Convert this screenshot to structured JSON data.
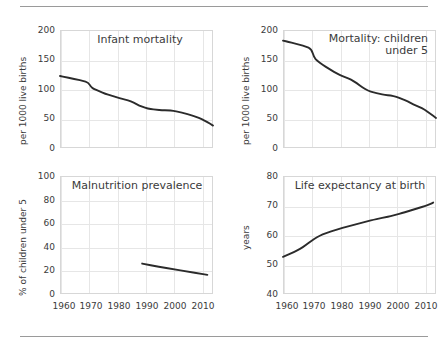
{
  "figure": {
    "background": "#ffffff",
    "line_color": "#2b2b2b",
    "grid_color": "#e6e6e6",
    "frame_color": "#d7d7d7",
    "rule_color": "#9a9a9a"
  },
  "panels": {
    "infant_mortality": {
      "title": "Infant mortality",
      "ylabel": "per 1000 live births",
      "yticks": [
        "200",
        "150",
        "100",
        "50",
        "0"
      ],
      "xticks": [
        "1960",
        "1970",
        "1980",
        "1990",
        "2000",
        "2010"
      ]
    },
    "under5_mortality": {
      "title": "Mortality: children\nunder 5",
      "ylabel": "per 1000 live births",
      "yticks": [
        "200",
        "150",
        "100",
        "50",
        "0"
      ],
      "xticks": [
        "1960",
        "1970",
        "1980",
        "1990",
        "2000",
        "2010"
      ]
    },
    "malnutrition": {
      "title": "Malnutrition prevalence",
      "ylabel": "% of children under 5",
      "yticks": [
        "100",
        "80",
        "60",
        "40",
        "20",
        "0"
      ],
      "xticks": [
        "1960",
        "1970",
        "1980",
        "1990",
        "2000",
        "2010"
      ]
    },
    "life_expectancy": {
      "title": "Life expectancy at birth",
      "ylabel": "years",
      "yticks": [
        "80",
        "70",
        "60",
        "50",
        "40"
      ],
      "xticks": [
        "1960",
        "1970",
        "1980",
        "1990",
        "2000",
        "2010"
      ]
    }
  },
  "chart_data": [
    {
      "type": "line",
      "title": "Infant mortality",
      "xlabel": "",
      "ylabel": "per 1000 live births",
      "xlim": [
        1960,
        2014
      ],
      "ylim": [
        0,
        200
      ],
      "ytick_values": [
        0,
        50,
        100,
        150,
        200
      ],
      "xtick_values": [
        1960,
        1970,
        1980,
        1990,
        2000,
        2010
      ],
      "grid": true,
      "legend": "none",
      "x": [
        1960,
        1962,
        1964,
        1966,
        1968,
        1970,
        1971,
        1972,
        1974,
        1976,
        1978,
        1980,
        1982,
        1984,
        1986,
        1988,
        1990,
        1992,
        1994,
        1996,
        1998,
        2000,
        2002,
        2004,
        2006,
        2008,
        2010,
        2012,
        2014
      ],
      "values": [
        122,
        120,
        118,
        116,
        114,
        111,
        103,
        100,
        96,
        92,
        89,
        86,
        83,
        81,
        77,
        72,
        68,
        66,
        65,
        64,
        64,
        63,
        61,
        59,
        56,
        53,
        49,
        44,
        38
      ]
    },
    {
      "type": "line",
      "title": "Mortality: children under 5",
      "xlabel": "",
      "ylabel": "per 1000 live births",
      "xlim": [
        1960,
        2014
      ],
      "ylim": [
        0,
        200
      ],
      "ytick_values": [
        0,
        50,
        100,
        150,
        200
      ],
      "xtick_values": [
        1960,
        1970,
        1980,
        1990,
        2000,
        2010
      ],
      "grid": true,
      "legend": "none",
      "x": [
        1960,
        1962,
        1964,
        1966,
        1968,
        1970,
        1971,
        1972,
        1974,
        1976,
        1978,
        1980,
        1982,
        1984,
        1986,
        1988,
        1990,
        1992,
        1994,
        1996,
        1998,
        2000,
        2002,
        2004,
        2006,
        2008,
        2010,
        2012,
        2014
      ],
      "values": [
        182,
        180,
        177,
        175,
        172,
        168,
        153,
        148,
        141,
        135,
        129,
        124,
        120,
        116,
        110,
        103,
        97,
        94,
        92,
        90,
        89,
        87,
        83,
        79,
        74,
        70,
        65,
        58,
        51
      ]
    },
    {
      "type": "line",
      "title": "Malnutrition prevalence",
      "xlabel": "",
      "ylabel": "% of children under 5",
      "xlim": [
        1960,
        2014
      ],
      "ylim": [
        0,
        100
      ],
      "ytick_values": [
        0,
        20,
        40,
        60,
        80,
        100
      ],
      "xtick_values": [
        1960,
        1970,
        1980,
        1990,
        2000,
        2010
      ],
      "grid": true,
      "legend": "none",
      "x": [
        1989,
        1995,
        2000,
        2005,
        2010,
        2012
      ],
      "values": [
        25.8,
        23.0,
        21.0,
        19.0,
        17.0,
        16.2
      ]
    },
    {
      "type": "line",
      "title": "Life expectancy at birth",
      "xlabel": "",
      "ylabel": "years",
      "xlim": [
        1960,
        2014
      ],
      "ylim": [
        40,
        80
      ],
      "ytick_values": [
        40,
        50,
        60,
        70,
        80
      ],
      "xtick_values": [
        1960,
        1970,
        1980,
        1990,
        2000,
        2010
      ],
      "grid": true,
      "legend": "none",
      "x": [
        1960,
        1962,
        1964,
        1966,
        1968,
        1970,
        1972,
        1974,
        1976,
        1978,
        1980,
        1982,
        1984,
        1986,
        1988,
        1990,
        1992,
        1994,
        1996,
        1998,
        2000,
        2002,
        2004,
        2006,
        2008,
        2010,
        2012,
        2013
      ],
      "values": [
        52.6,
        53.4,
        54.3,
        55.3,
        56.5,
        58.0,
        59.3,
        60.2,
        60.9,
        61.5,
        62.1,
        62.7,
        63.2,
        63.7,
        64.2,
        64.7,
        65.2,
        65.6,
        66.0,
        66.4,
        66.9,
        67.4,
        68.0,
        68.6,
        69.2,
        69.8,
        70.5,
        71.0
      ]
    }
  ]
}
